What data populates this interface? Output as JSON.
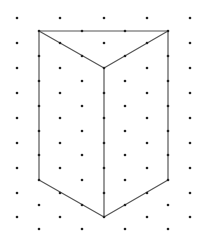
{
  "diagram": {
    "colors": {
      "background": "#ffffff",
      "dot": "#222222",
      "line": "#555555"
    },
    "grid": {
      "even_columns_x": [
        17,
        60,
        104,
        147,
        190
      ],
      "even_rows_y": [
        18,
        43,
        68,
        93,
        118,
        143,
        168,
        193,
        217
      ],
      "odd_columns_x": [
        39,
        82,
        125,
        168
      ],
      "odd_rows_y": [
        31,
        56,
        81,
        106,
        131,
        155,
        180,
        205,
        229
      ],
      "dot_radius": 1.3
    },
    "shape": {
      "vertices": {
        "top_left": [
          39,
          31
        ],
        "top_right": [
          168,
          31
        ],
        "top_center": [
          104,
          68
        ],
        "bottom_left": [
          39,
          180
        ],
        "bottom_right": [
          168,
          180
        ],
        "bottom_center": [
          104,
          217
        ]
      },
      "edges": [
        [
          "top_left",
          "top_right"
        ],
        [
          "top_left",
          "top_center"
        ],
        [
          "top_right",
          "top_center"
        ],
        [
          "top_left",
          "bottom_left"
        ],
        [
          "top_right",
          "bottom_right"
        ],
        [
          "top_center",
          "bottom_center"
        ],
        [
          "bottom_left",
          "bottom_center"
        ],
        [
          "bottom_right",
          "bottom_center"
        ]
      ]
    }
  }
}
